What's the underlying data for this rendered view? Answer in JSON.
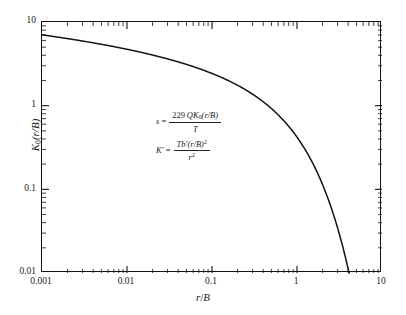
{
  "chart_data": {
    "type": "line",
    "title": "",
    "xlabel": "r/B",
    "ylabel": "K0(r/B)",
    "xscale": "log",
    "yscale": "log",
    "xlim": [
      0.001,
      10
    ],
    "ylim": [
      0.01,
      10
    ],
    "grid": false,
    "legend": null,
    "xticks": [
      "0.001",
      "0.01",
      "0.1",
      "1",
      "10"
    ],
    "xtick_values": [
      0.001,
      0.01,
      0.1,
      1,
      10
    ],
    "yticks": [
      "0.01",
      "0.1",
      "1",
      "10"
    ],
    "ytick_values": [
      0.01,
      0.1,
      1,
      10
    ],
    "series": [
      {
        "name": "K0(r/B)",
        "x": [
          0.001,
          0.002,
          0.005,
          0.01,
          0.02,
          0.05,
          0.1,
          0.2,
          0.3,
          0.5,
          0.7,
          1.0,
          1.5,
          2.0,
          2.5,
          3.0,
          3.5,
          4.0,
          4.2
        ],
        "y": [
          7.02,
          6.33,
          5.41,
          4.72,
          4.03,
          3.11,
          2.43,
          1.75,
          1.37,
          0.924,
          0.661,
          0.421,
          0.214,
          0.114,
          0.0623,
          0.0347,
          0.0196,
          0.0112,
          0.0089
        ]
      }
    ],
    "annotations": [
      {
        "id": "drawdown-equation",
        "lhs": "s",
        "relation": "=",
        "numerator_coefficient": "229",
        "numerator": "QK0(r/B)",
        "denominator": "T"
      },
      {
        "id": "leakance-equation",
        "lhs": "K'",
        "relation": "=",
        "numerator": "Tb'(r/B)2",
        "denominator": "r2"
      }
    ]
  },
  "axes": {
    "y_label_text": "K",
    "y_label_sub": "0",
    "y_label_rest": "(r/B)",
    "x_label_num": "r",
    "x_label_slash": "/",
    "x_label_den": "B",
    "ytick_10": "10",
    "ytick_1": "1",
    "ytick_0_1": "0.1",
    "ytick_0_01": "0.01",
    "xtick_0_001": "0.001",
    "xtick_0_01": "0.01",
    "xtick_0_1": "0.1",
    "xtick_1": "1",
    "xtick_10": "10"
  },
  "equations": {
    "eq1_lhs": "s",
    "eq1_eq": "=",
    "eq1_coef": "229",
    "eq1_num_q": "Q",
    "eq1_num_k": "K",
    "eq1_num_sub": "0",
    "eq1_num_arg": "(r/B)",
    "eq1_den": "T",
    "eq2_lhs": "K",
    "eq2_lhs_prime": "′",
    "eq2_eq": "=",
    "eq2_num_t": "Tb",
    "eq2_num_prime": "′",
    "eq2_num_arg": "(r/B)",
    "eq2_num_exp": "2",
    "eq2_den_r": "r",
    "eq2_den_exp": "2"
  },
  "style": {
    "curve_color": "#111111",
    "axis_color": "#111111",
    "background": "#ffffff"
  }
}
